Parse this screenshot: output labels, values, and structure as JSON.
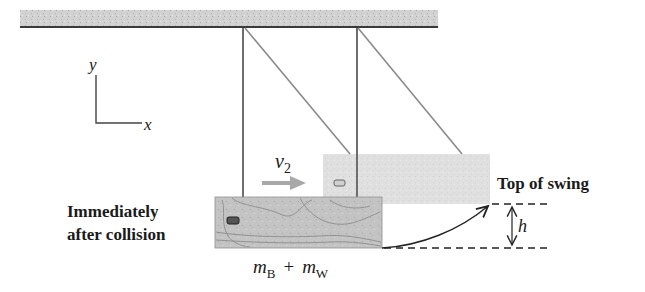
{
  "figure": {
    "type": "physics-diagram"
  },
  "axes": {
    "y_label": "y",
    "x_label": "x"
  },
  "velocity": {
    "label_main": "v",
    "label_sub": "2"
  },
  "labels": {
    "top_of_swing": "Top of swing",
    "immediately_line1": "Immediately",
    "immediately_line2": "after collision",
    "height": "h"
  },
  "mass": {
    "m1": "m",
    "m1_sub": "B",
    "plus": "+",
    "m2": "m",
    "m2_sub": "W"
  },
  "colors": {
    "ceiling_fill": "#c9c9c9",
    "line": "#444444",
    "string": "#7a7a7a",
    "block_top": "#dcdcdc",
    "block_bottom": "#bdbdbd",
    "arrow_gray": "#a8a8a8",
    "text": "#1a1a1a"
  }
}
